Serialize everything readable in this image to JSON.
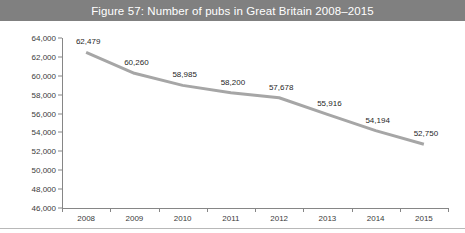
{
  "figure": {
    "title": "Figure 57: Number of pubs in Great Britain 2008–2015",
    "banner_color": "#808080",
    "banner_text_color": "#ffffff"
  },
  "chart_data": {
    "type": "line",
    "title": "Figure 57: Number of pubs in Great Britain 2008–2015",
    "xlabel": "",
    "ylabel": "",
    "categories": [
      "2008",
      "2009",
      "2010",
      "2011",
      "2012",
      "2013",
      "2014",
      "2015"
    ],
    "values": [
      62479,
      60260,
      58985,
      58200,
      57678,
      55916,
      54194,
      52750
    ],
    "point_labels": [
      "62,479",
      "60,260",
      "58,985",
      "58,200",
      "57,678",
      "55,916",
      "54,194",
      "52,750"
    ],
    "ylim": [
      46000,
      64000
    ],
    "ytick_values": [
      64000,
      62000,
      60000,
      58000,
      56000,
      54000,
      52000,
      50000,
      48000,
      46000
    ],
    "ytick_labels": [
      "64,000",
      "62,000",
      "60,000",
      "58,000",
      "56,000",
      "54,000",
      "52,000",
      "50,000",
      "48,000",
      "46,000"
    ],
    "grid": false,
    "legend": false,
    "legend_position": "none",
    "series_color": "#a6a6a6",
    "series_line_width": 3,
    "axis_color": "#868686",
    "label_text_color": "#1f1f1f"
  }
}
